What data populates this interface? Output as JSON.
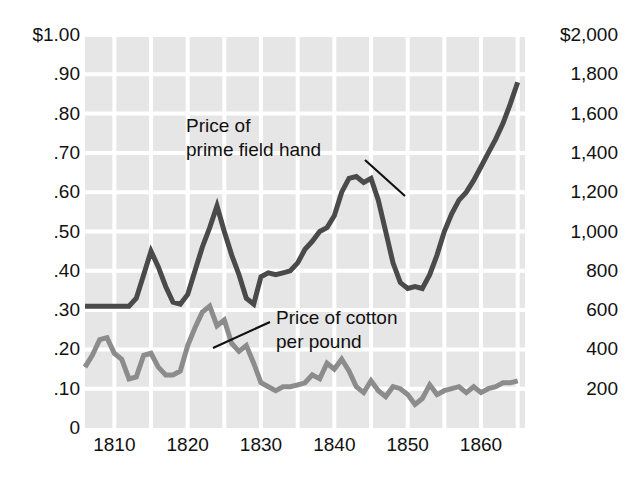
{
  "chart_data": {
    "type": "line",
    "title": "",
    "xlabel": "",
    "ylabel_left": "",
    "ylabel_right": "",
    "xlim": [
      1806,
      1866
    ],
    "grid": true,
    "gridline_years": [
      1810,
      1815,
      1820,
      1825,
      1830,
      1835,
      1840,
      1845,
      1850,
      1855,
      1860,
      1865
    ],
    "plot_background": "#e6e6e6",
    "gridline_color": "#ffffff",
    "x_tick_labels": [
      "1810",
      "1820",
      "1830",
      "1840",
      "1850",
      "1860"
    ],
    "x_tick_values": [
      1810,
      1820,
      1830,
      1840,
      1850,
      1860
    ],
    "left_axis": {
      "tick_labels": [
        "$1.00",
        ".90",
        ".80",
        ".70",
        ".60",
        ".50",
        ".40",
        ".30",
        ".20",
        ".10",
        "0"
      ],
      "tick_values": [
        1.0,
        0.9,
        0.8,
        0.7,
        0.6,
        0.5,
        0.4,
        0.3,
        0.2,
        0.1,
        0
      ],
      "ylim": [
        0,
        1.0
      ]
    },
    "right_axis": {
      "tick_labels": [
        "$2,000",
        "1,800",
        "1,600",
        "1,400",
        "1,200",
        "1,000",
        "800",
        "600",
        "400",
        "200"
      ],
      "tick_values": [
        2000,
        1800,
        1600,
        1400,
        1200,
        1000,
        800,
        600,
        400,
        200
      ],
      "ylim": [
        0,
        2000
      ]
    },
    "annotations": [
      {
        "name": "slave-price-annotation",
        "text": "Price of\nprime field hand",
        "leader_from": [
          365,
          160
        ],
        "leader_to": [
          405,
          196
        ]
      },
      {
        "name": "cotton-price-annotation",
        "text": "Price of cotton\nper pound",
        "leader_from": [
          270,
          322
        ],
        "leader_to": [
          213,
          348
        ]
      }
    ],
    "series": [
      {
        "name": "Price of prime field hand",
        "axis": "right",
        "color": "#4a4a4a",
        "line_width": 5,
        "unit": "dollars (right scale)",
        "x": [
          1806,
          1807,
          1808,
          1809,
          1810,
          1811,
          1812,
          1813,
          1814,
          1815,
          1816,
          1817,
          1818,
          1819,
          1820,
          1821,
          1822,
          1823,
          1824,
          1825,
          1826,
          1827,
          1828,
          1829,
          1830,
          1831,
          1832,
          1833,
          1834,
          1835,
          1836,
          1837,
          1838,
          1839,
          1840,
          1841,
          1842,
          1843,
          1844,
          1845,
          1846,
          1847,
          1848,
          1849,
          1850,
          1851,
          1852,
          1853,
          1854,
          1855,
          1856,
          1857,
          1858,
          1859,
          1860,
          1861,
          1862,
          1863,
          1864,
          1865
        ],
        "y": [
          0.31,
          0.31,
          0.31,
          0.31,
          0.31,
          0.31,
          0.31,
          0.33,
          0.39,
          0.45,
          0.41,
          0.36,
          0.32,
          0.315,
          0.34,
          0.4,
          0.46,
          0.51,
          0.565,
          0.5,
          0.44,
          0.39,
          0.33,
          0.315,
          0.385,
          0.395,
          0.39,
          0.395,
          0.4,
          0.42,
          0.455,
          0.475,
          0.5,
          0.51,
          0.54,
          0.6,
          0.635,
          0.64,
          0.625,
          0.635,
          0.58,
          0.5,
          0.42,
          0.37,
          0.355,
          0.36,
          0.355,
          0.39,
          0.44,
          0.5,
          0.545,
          0.58,
          0.6,
          0.63,
          0.665,
          0.7,
          0.735,
          0.775,
          0.825,
          0.88
        ]
      },
      {
        "name": "Price of cotton per pound",
        "axis": "left",
        "color": "#8c8c8c",
        "line_width": 5,
        "unit": "dollars per pound (left scale)",
        "x": [
          1806,
          1807,
          1808,
          1809,
          1810,
          1811,
          1812,
          1813,
          1814,
          1815,
          1816,
          1817,
          1818,
          1819,
          1820,
          1821,
          1822,
          1823,
          1824,
          1825,
          1826,
          1827,
          1828,
          1829,
          1830,
          1831,
          1832,
          1833,
          1834,
          1835,
          1836,
          1837,
          1838,
          1839,
          1840,
          1841,
          1842,
          1843,
          1844,
          1845,
          1846,
          1847,
          1848,
          1849,
          1850,
          1851,
          1852,
          1853,
          1854,
          1855,
          1856,
          1857,
          1858,
          1859,
          1860,
          1861,
          1862,
          1863,
          1864,
          1865
        ],
        "y": [
          0.155,
          0.185,
          0.225,
          0.23,
          0.19,
          0.175,
          0.125,
          0.13,
          0.185,
          0.19,
          0.155,
          0.135,
          0.135,
          0.145,
          0.21,
          0.255,
          0.295,
          0.31,
          0.26,
          0.275,
          0.215,
          0.195,
          0.21,
          0.165,
          0.115,
          0.105,
          0.095,
          0.105,
          0.105,
          0.11,
          0.115,
          0.135,
          0.125,
          0.165,
          0.15,
          0.175,
          0.145,
          0.105,
          0.09,
          0.12,
          0.095,
          0.08,
          0.105,
          0.1,
          0.085,
          0.06,
          0.075,
          0.11,
          0.085,
          0.095,
          0.1,
          0.105,
          0.09,
          0.105,
          0.09,
          0.1,
          0.105,
          0.115,
          0.115,
          0.12
        ]
      }
    ]
  }
}
